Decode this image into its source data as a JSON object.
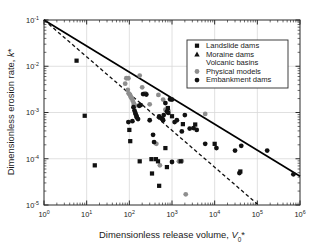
{
  "chart_data": {
    "type": "scatter",
    "title": "",
    "xlabel": "Dimensionless release volume, V0*",
    "ylabel": "Dimensionless erosion rate, k*",
    "xscale": "log",
    "yscale": "log",
    "xlim": [
      1,
      1000000
    ],
    "ylim": [
      1e-05,
      0.1
    ],
    "grid": true,
    "grid_color": "#d8d8d8",
    "xticks": [
      1,
      10,
      100,
      1000,
      10000,
      100000,
      1000000
    ],
    "xticklabels": [
      "10⁰",
      "10¹",
      "10²",
      "10³",
      "10⁴",
      "10⁵",
      "10⁶"
    ],
    "xtick_bases": [
      "10",
      "10",
      "10",
      "10",
      "10",
      "10",
      "10"
    ],
    "xtick_exps": [
      "0",
      "1",
      "2",
      "3",
      "4",
      "5",
      "6"
    ],
    "yticks": [
      0.1,
      0.01,
      0.001,
      0.0001,
      1e-05
    ],
    "yticklabels": [
      "10⁻¹",
      "10⁻²",
      "10⁻³",
      "10⁻⁴",
      "10⁻⁵"
    ],
    "ytick_bases": [
      "10",
      "10",
      "10",
      "10",
      "10"
    ],
    "ytick_exps": [
      "-1",
      "-2",
      "-3",
      "-4",
      "-5"
    ],
    "legend_position": "upper right",
    "legend": [
      {
        "label": "Landslide dams",
        "marker": "square",
        "color": "#111111",
        "filled": true
      },
      {
        "label": "Moraine dams",
        "marker": "triangle-up",
        "color": "#111111",
        "filled": true
      },
      {
        "label": "Volcanic basins",
        "marker": "triangle-down",
        "color": "#111111",
        "filled": false
      },
      {
        "label": "Physical models",
        "marker": "circle",
        "color": "#8e8e8e",
        "filled": true
      },
      {
        "label": "Embankment dams",
        "marker": "circle",
        "color": "#111111",
        "filled": true
      }
    ],
    "lines": [
      {
        "name": "upper-envelope",
        "style": "solid",
        "color": "#000000",
        "x": [
          1,
          1000000
        ],
        "y": [
          0.1,
          4.2e-05
        ]
      },
      {
        "name": "best-fit-trend",
        "style": "dashed",
        "color": "#111111",
        "x": [
          1,
          100000
        ],
        "y": [
          0.1,
          1.05e-05
        ]
      }
    ],
    "series": [
      {
        "name": "Landslide dams",
        "marker": "square",
        "color": "#111111",
        "filled": true,
        "points": [
          [
            5.8,
            0.0132
          ],
          [
            9.0,
            0.00085
          ],
          [
            15.5,
            7.2e-05
          ],
          [
            100,
            0.00042
          ],
          [
            105,
            0.00024
          ],
          [
            175,
            8.8e-05
          ],
          [
            330,
            9.8e-05
          ],
          [
            340,
            4.8e-05
          ],
          [
            420,
            9.8e-05
          ],
          [
            470,
            8.8e-05
          ],
          [
            500,
            2.6e-05
          ],
          [
            700,
            0.00017
          ],
          [
            760,
            6.6e-05
          ],
          [
            800,
            0.00125
          ],
          [
            1000,
            0.00083
          ],
          [
            1600,
            8.8e-05
          ],
          [
            1800,
            0.00056
          ],
          [
            3500,
            0.00055
          ],
          [
            10000,
            0.00021
          ],
          [
            40000,
            5.3e-05
          ]
        ]
      },
      {
        "name": "Moraine dams",
        "marker": "triangle-up",
        "color": "#111111",
        "filled": true,
        "points": []
      },
      {
        "name": "Volcanic basins",
        "marker": "triangle-down",
        "color": "#111111",
        "filled": false,
        "points": [
          [
            6000,
            4.6e-05
          ]
        ]
      },
      {
        "name": "Physical models",
        "marker": "circle",
        "color": "#8e8e8e",
        "filled": true,
        "points": [
          [
            85,
            0.0055
          ],
          [
            95,
            0.0055
          ],
          [
            80,
            0.0042
          ],
          [
            92,
            0.0031
          ],
          [
            96,
            0.0026
          ],
          [
            100,
            0.0025
          ],
          [
            104,
            0.0024
          ],
          [
            108,
            0.0022
          ],
          [
            110,
            0.0021
          ],
          [
            115,
            0.002
          ],
          [
            120,
            0.0018
          ],
          [
            126,
            0.0016
          ],
          [
            130,
            0.0015
          ],
          [
            135,
            0.0014
          ],
          [
            175,
            0.0063
          ],
          [
            200,
            0.0035
          ],
          [
            235,
            0.0026
          ],
          [
            300,
            0.0015
          ],
          [
            480,
            0.0024
          ],
          [
            620,
            0.0019
          ],
          [
            700,
            0.00115
          ],
          [
            820,
            0.0011
          ],
          [
            900,
            0.0019
          ],
          [
            430,
            0.00021
          ],
          [
            520,
            7.2e-05
          ],
          [
            1450,
            8.8e-05
          ],
          [
            1700,
            8.9e-05
          ],
          [
            2100,
            1.7e-05
          ],
          [
            6000,
            0.00093
          ]
        ]
      },
      {
        "name": "Embankment dams",
        "marker": "circle",
        "color": "#111111",
        "filled": true,
        "points": [
          [
            125,
            0.0013
          ],
          [
            132,
            0.0011
          ],
          [
            138,
            0.00098
          ],
          [
            142,
            0.0009
          ],
          [
            148,
            0.00082
          ],
          [
            150,
            0.00078
          ],
          [
            118,
            0.00065
          ],
          [
            160,
            0.00072
          ],
          [
            170,
            0.0014
          ],
          [
            185,
            0.00145
          ],
          [
            210,
            0.0025
          ],
          [
            250,
            0.00245
          ],
          [
            300,
            0.00068
          ],
          [
            360,
            0.00033
          ],
          [
            380,
            0.00023
          ],
          [
            500,
            0.00082
          ],
          [
            560,
            0.00075
          ],
          [
            600,
            0.00072
          ],
          [
            620,
            0.00068
          ],
          [
            640,
            0.00088
          ],
          [
            700,
            0.0016
          ],
          [
            760,
            0.00105
          ],
          [
            820,
            0.00098
          ],
          [
            900,
            0.00195
          ],
          [
            1000,
            0.0019
          ],
          [
            1150,
            0.00062
          ],
          [
            1300,
            0.00068
          ],
          [
            1700,
            0.00039
          ],
          [
            2000,
            0.00088
          ],
          [
            2600,
            0.00045
          ],
          [
            3200,
            0.00046
          ],
          [
            3800,
            0.00042
          ],
          [
            6000,
            0.00021
          ],
          [
            11000,
            0.00017
          ],
          [
            30000,
            0.00015
          ],
          [
            38000,
            4.9e-05
          ],
          [
            42000,
            0.00019
          ],
          [
            170000,
            0.00015
          ],
          [
            700000,
            4.6e-05
          ],
          [
            95,
            0.00062
          ],
          [
            1000,
            8.5e-05
          ]
        ]
      }
    ]
  },
  "axes": {
    "y_label_main": "Dimensionless erosion rate, ",
    "y_label_var": "k",
    "y_label_star": "*",
    "x_label_main": "Dimensionless release volume, ",
    "x_label_var": "V",
    "x_label_sub": "0",
    "x_label_star": "*"
  }
}
